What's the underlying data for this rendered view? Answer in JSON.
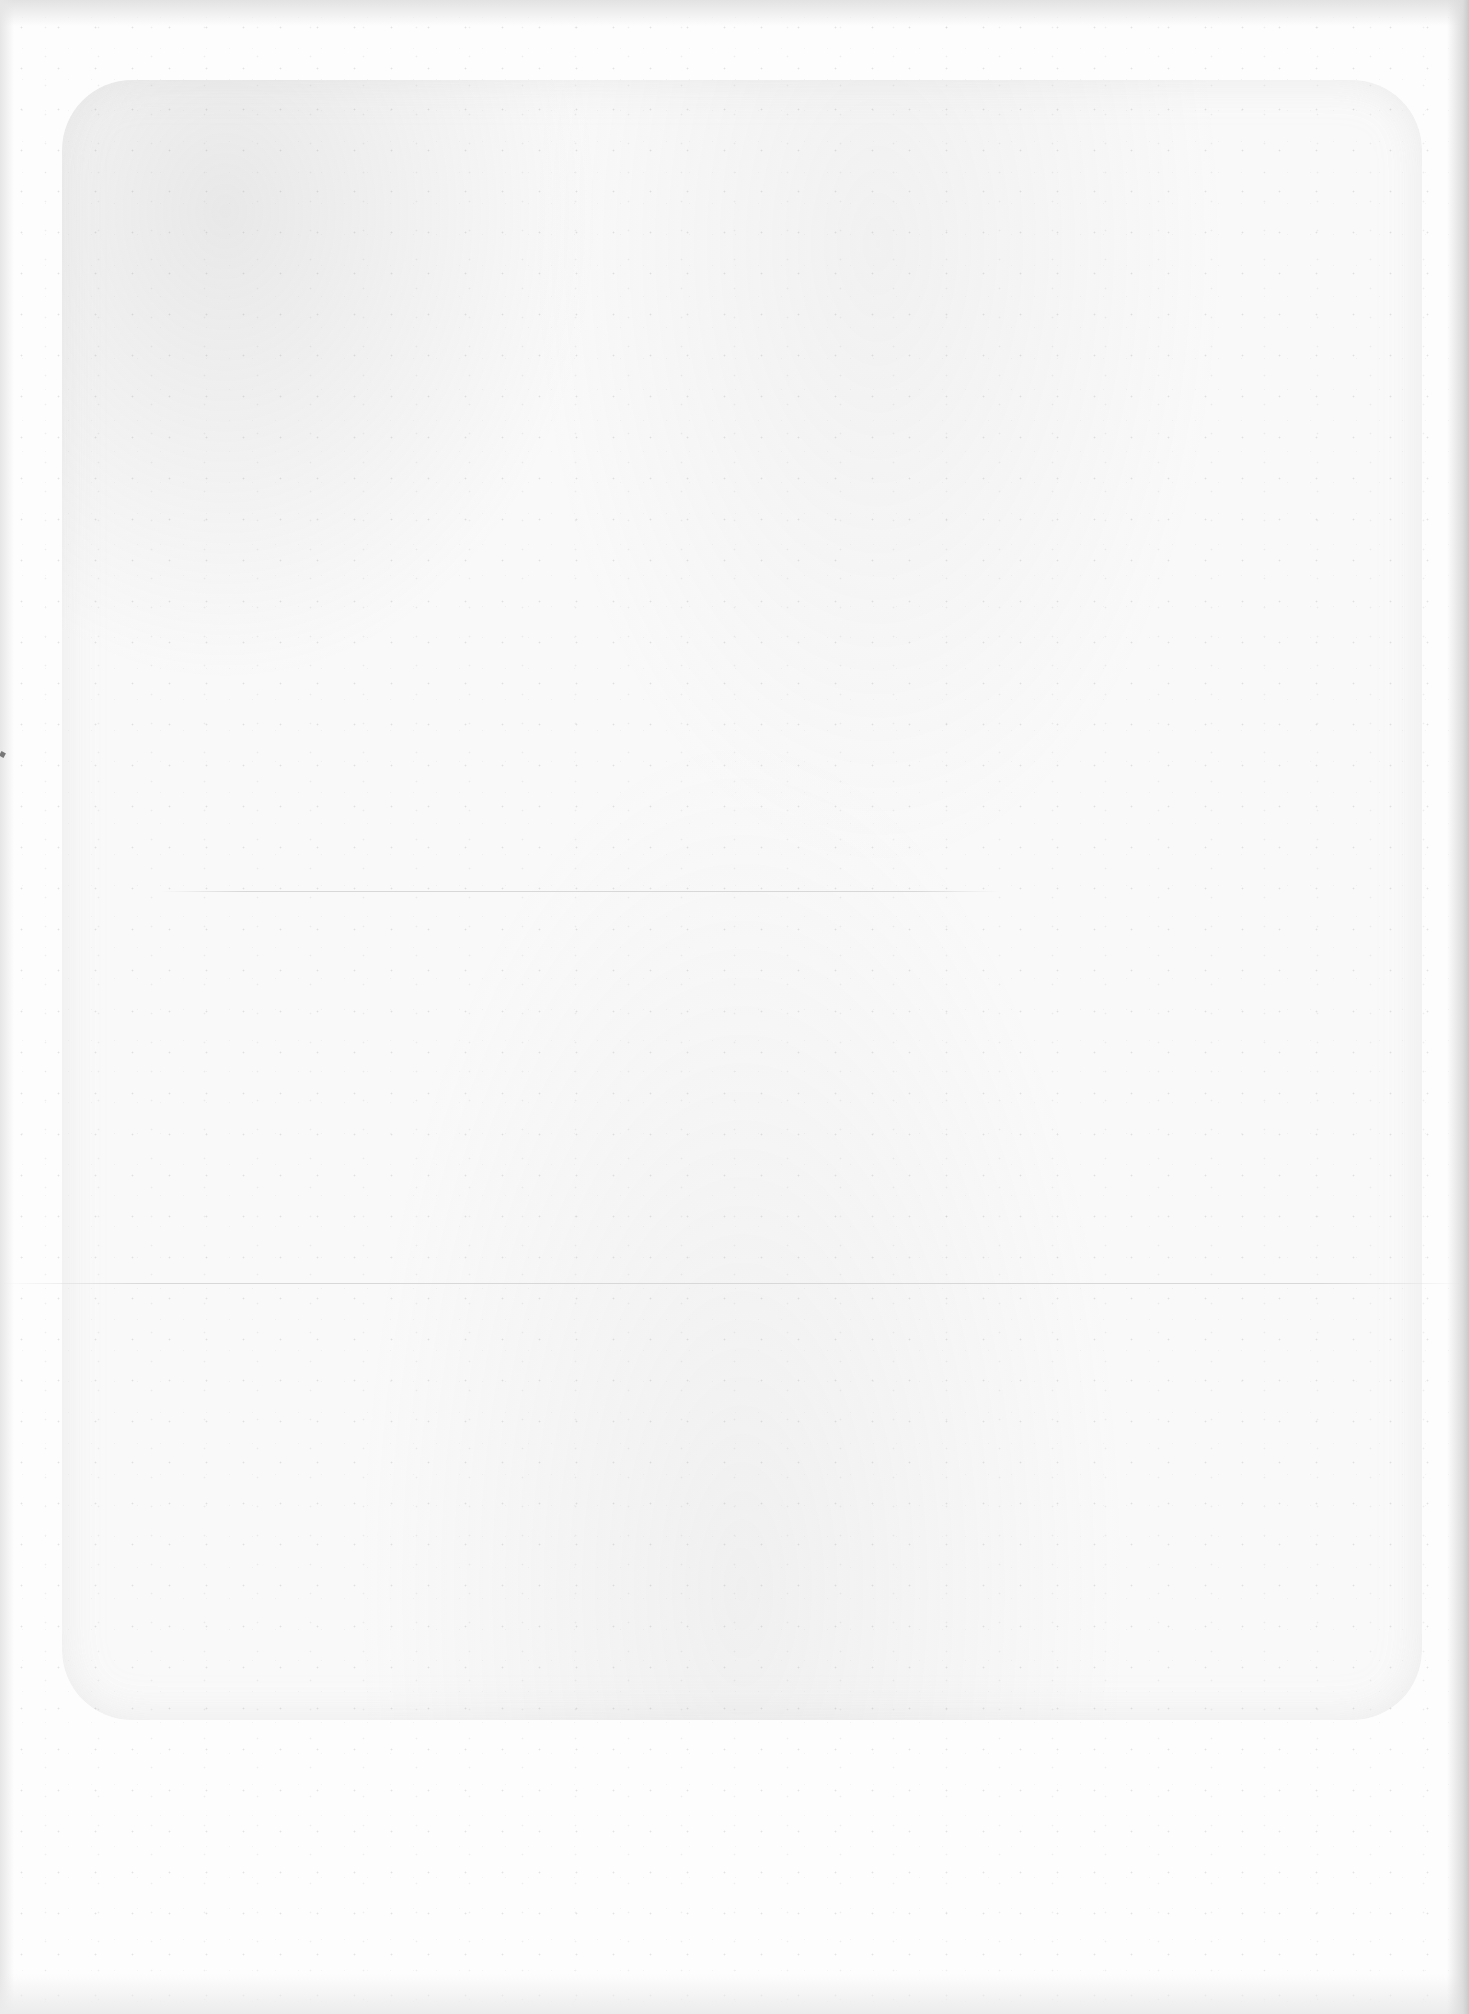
{
  "page": {
    "type": "blank-scanned-page",
    "text_content": "",
    "colors": {
      "paper": "#fdfdfd",
      "scan_border": "#e2e2e2",
      "right_shadow": "#c9c9c9",
      "fold_line": "#d8d8d8",
      "edge_mark": "#777777"
    },
    "features": [
      "faint-rounded-rectangle-impression",
      "upper-fold-line",
      "lower-fold-line",
      "right-edge-shadow",
      "left-edge-mark",
      "speckle-noise"
    ]
  }
}
